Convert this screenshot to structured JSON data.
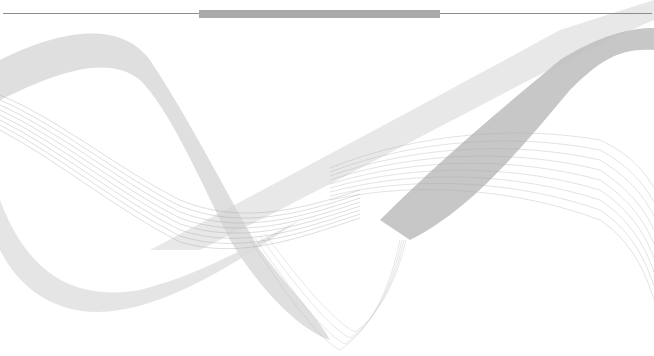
{
  "slide": {
    "background": "#ffffff",
    "header_rule_color": "#8c8c8c",
    "header_bar_color": "#a9a9a9",
    "wave_color": "#9a9a9a",
    "wave_fill": "#d8d8d8"
  }
}
